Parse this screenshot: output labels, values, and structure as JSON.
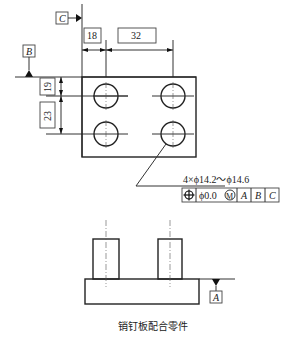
{
  "drawing": {
    "caption": "销钉板配合零件",
    "datums": {
      "a": "A",
      "b": "B",
      "c": "C"
    },
    "dimensions": {
      "horizontal_1": "18",
      "horizontal_2": "32",
      "vertical_1": "19",
      "vertical_2": "23"
    },
    "hole_callout": "4×ϕ14.2～ϕ14.6",
    "feature_control_frame": {
      "symbol": "position-icon",
      "tolerance": "ϕ0.0",
      "modifier": "M",
      "datum_1": "A",
      "datum_2": "B",
      "datum_3": "C"
    }
  }
}
